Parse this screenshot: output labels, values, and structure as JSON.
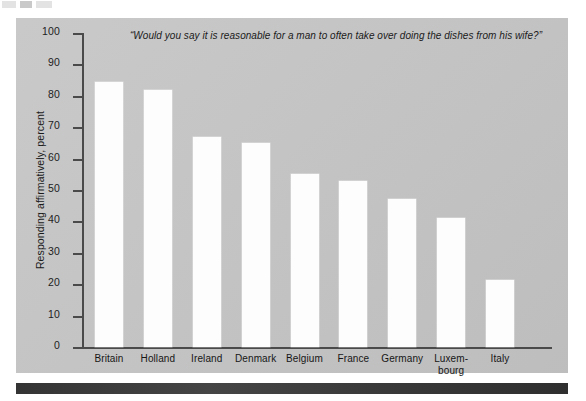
{
  "figure": {
    "background_color": "#c6c6c6",
    "bar_color": "#fdfdfd",
    "axis_color": "#4a4a4a",
    "rule_color": "#3b3b3b"
  },
  "artifacts": {
    "mark_a": "",
    "mark_b": "",
    "mark_c": ""
  },
  "chart_data": {
    "type": "bar",
    "title": "“Would you say it is reasonable for a man to often take over doing the dishes from his wife?”",
    "xlabel": "",
    "ylabel": "Responding affirmatively, percent",
    "ylim": [
      0,
      100
    ],
    "ytick_values": [
      0,
      10,
      20,
      30,
      40,
      50,
      60,
      70,
      80,
      90,
      100
    ],
    "ytick_labels": [
      "0",
      "10",
      "20",
      "30",
      "40",
      "50",
      "60",
      "70",
      "80",
      "90",
      "100"
    ],
    "grid": false,
    "legend": null,
    "orientation": "vertical",
    "categories": [
      "Britain",
      "Holland",
      "Ireland",
      "Denmark",
      "Belgium",
      "France",
      "Germany",
      "Luxem-\nbourg",
      "Italy"
    ],
    "category_labels": [
      "Britain",
      "Holland",
      "Ireland",
      "Denmark",
      "Belgium",
      "France",
      "Germany",
      "Luxem-",
      "Italy"
    ],
    "category_labels_line2": [
      "",
      "",
      "",
      "",
      "",
      "",
      "",
      "bourg",
      ""
    ],
    "values": [
      84.5,
      82,
      67,
      65,
      55,
      53,
      47,
      41,
      21.5
    ],
    "value_labels": [
      "84.5",
      "82",
      "67",
      "65",
      "55",
      "53",
      "47",
      "41",
      "21.5"
    ]
  }
}
